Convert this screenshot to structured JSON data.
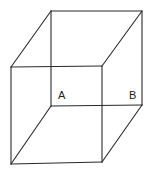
{
  "figure": {
    "type": "necker-cube",
    "stroke_color": "#2a2a2a",
    "background": "#ffffff",
    "vertices": {
      "front_top_left": [
        11,
        67
      ],
      "front_top_right": [
        102,
        66
      ],
      "front_bottom_left": [
        11,
        164
      ],
      "front_bottom_right": [
        102,
        162
      ],
      "back_top_left": [
        51,
        11
      ],
      "back_top_right": [
        142,
        11
      ],
      "back_bottom_left": [
        51,
        106
      ],
      "back_bottom_right": [
        142,
        105
      ]
    },
    "labels": [
      {
        "id": "A",
        "text": "A",
        "x": 58,
        "y": 99
      },
      {
        "id": "B",
        "text": "B",
        "x": 129,
        "y": 99
      }
    ]
  }
}
